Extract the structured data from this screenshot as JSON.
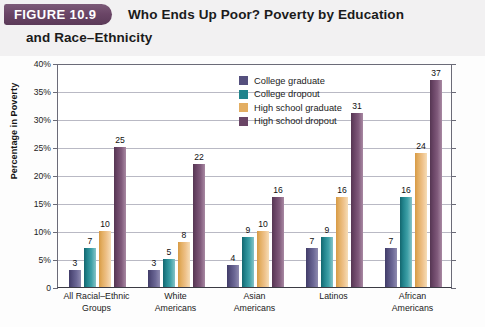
{
  "header": {
    "figure_tab": "FIGURE 10.9",
    "title_line1": "Who Ends Up Poor? Poverty by Education",
    "title_line2": "and Race–Ethnicity",
    "tab_color": "#6a4566"
  },
  "chart_data": {
    "type": "bar",
    "title": "Who Ends Up Poor? Poverty by Education and Race–Ethnicity",
    "xlabel": "",
    "ylabel": "Percentage in Poverty",
    "ylim": [
      0,
      40
    ],
    "grid": true,
    "legend_position": "inside-top-center",
    "ytick_labels": [
      "0",
      "5%",
      "10%",
      "15%",
      "20%",
      "25%",
      "30%",
      "35%",
      "40%"
    ],
    "ytick_values": [
      0,
      5,
      10,
      15,
      20,
      25,
      30,
      35,
      40
    ],
    "categories": [
      "All Racial–Ethnic Groups",
      "White Americans",
      "Asian Americans",
      "Latinos",
      "African Americans"
    ],
    "category_lines": [
      [
        "All Racial–Ethnic",
        "Groups"
      ],
      [
        "White",
        "Americans"
      ],
      [
        "Asian",
        "Americans"
      ],
      [
        "Latinos",
        ""
      ],
      [
        "African",
        "Americans"
      ]
    ],
    "series": [
      {
        "name": "College graduate",
        "color": "#55507e",
        "values": [
          3,
          3,
          4,
          7,
          7
        ]
      },
      {
        "name": "College dropout",
        "color": "#21838c",
        "values": [
          7,
          5,
          9,
          9,
          16
        ]
      },
      {
        "name": "High school graduate",
        "color": "#e3ae62",
        "values": [
          10,
          8,
          10,
          16,
          24
        ]
      },
      {
        "name": "High school dropout",
        "color": "#6a4566",
        "values": [
          25,
          22,
          16,
          31,
          37
        ]
      }
    ]
  }
}
